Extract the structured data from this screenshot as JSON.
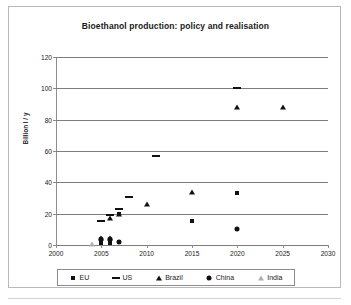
{
  "chart_data": {
    "type": "scatter",
    "title": "Bioethanol production: policy and realisation",
    "xlabel": "",
    "ylabel": "Billion l / y",
    "xlim": [
      2000,
      2030
    ],
    "ylim": [
      0,
      120
    ],
    "xticks": [
      2000,
      2005,
      2010,
      2015,
      2020,
      2025,
      2030
    ],
    "yticks": [
      0,
      20,
      40,
      60,
      80,
      100,
      120
    ],
    "grid": "horizontal",
    "legend_position": "bottom",
    "series": [
      {
        "name": "EU",
        "marker": "square",
        "color": "#111111",
        "points": [
          {
            "x": 2005,
            "y": 1.0
          },
          {
            "x": 2006,
            "y": 1.5
          },
          {
            "x": 2007,
            "y": 2.2
          },
          {
            "x": 2007,
            "y": 19.5
          },
          {
            "x": 2015,
            "y": 15.5
          },
          {
            "x": 2020,
            "y": 33.5
          }
        ]
      },
      {
        "name": "US",
        "marker": "dash",
        "color": "#111111",
        "points": [
          {
            "x": 2005,
            "y": 15.5
          },
          {
            "x": 2006,
            "y": 19.0
          },
          {
            "x": 2007,
            "y": 23.0
          },
          {
            "x": 2008,
            "y": 30.5
          },
          {
            "x": 2011,
            "y": 56.5
          },
          {
            "x": 2020,
            "y": 100.0
          }
        ]
      },
      {
        "name": "Brazil",
        "marker": "triangle",
        "color": "#111111",
        "points": [
          {
            "x": 2005,
            "y": 4.5
          },
          {
            "x": 2006,
            "y": 17.0
          },
          {
            "x": 2006,
            "y": 4.5
          },
          {
            "x": 2007,
            "y": 19.5
          },
          {
            "x": 2010,
            "y": 26.0
          },
          {
            "x": 2015,
            "y": 34.0
          },
          {
            "x": 2020,
            "y": 88.0
          },
          {
            "x": 2025,
            "y": 88.0
          }
        ]
      },
      {
        "name": "China",
        "marker": "circle",
        "color": "#111111",
        "points": [
          {
            "x": 2005,
            "y": 4.0
          },
          {
            "x": 2006,
            "y": 4.0
          },
          {
            "x": 2007,
            "y": 2.0
          },
          {
            "x": 2020,
            "y": 10.5
          }
        ]
      },
      {
        "name": "India",
        "marker": "triangle-light",
        "color": "#b0b0b0",
        "points": [
          {
            "x": 2004,
            "y": 0.4
          }
        ]
      }
    ]
  },
  "legend": {
    "entries": [
      {
        "label": "EU",
        "marker": "square"
      },
      {
        "label": "US",
        "marker": "dash"
      },
      {
        "label": "Brazil",
        "marker": "triangle"
      },
      {
        "label": "China",
        "marker": "circle"
      },
      {
        "label": "India",
        "marker": "triangle-light"
      }
    ]
  }
}
